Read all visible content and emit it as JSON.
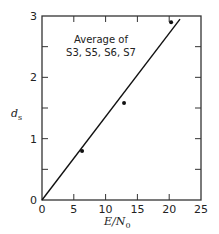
{
  "chart_data": {
    "type": "scatter",
    "title": "",
    "xlabel": "E/N0",
    "xlabel_main": "E/N",
    "xlabel_sub": "0",
    "ylabel": "ds",
    "ylabel_main": "d",
    "ylabel_sub": "s",
    "xlim": [
      0,
      25
    ],
    "ylim": [
      0,
      3
    ],
    "x_ticks": [
      0,
      5,
      10,
      15,
      20,
      25
    ],
    "x_tick_labels": [
      "0",
      "5",
      "10",
      "15",
      "20",
      "25"
    ],
    "y_ticks": [
      0,
      0.5,
      1,
      1.5,
      2,
      2.5,
      3
    ],
    "y_tick_labels": [
      "0",
      "",
      "1",
      "",
      "2",
      "",
      "3"
    ],
    "grid": false,
    "legend": null,
    "annotation": [
      "Average of",
      "S3, S5, S6, S7"
    ],
    "series": [
      {
        "name": "Average of S3, S5, S6, S7",
        "kind": "points",
        "x": [
          6.3,
          12.9,
          20.3
        ],
        "y": [
          0.8,
          1.58,
          2.9
        ]
      },
      {
        "name": "fit line",
        "kind": "line",
        "x": [
          0,
          21.7
        ],
        "y": [
          0,
          2.95
        ]
      }
    ]
  }
}
